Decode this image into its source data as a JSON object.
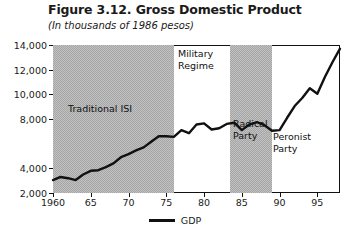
{
  "title": "Figure 3.12. Gross Domestic Product",
  "subtitle": "(In thousands of 1986 pesos)",
  "legend": {
    "label": "GDP"
  },
  "bands": [
    {
      "label": "Traditional ISI",
      "start": 1960,
      "end": 1976,
      "shaded": true
    },
    {
      "label": "Military\nRegime",
      "start": 1976,
      "end": 1983.5,
      "shaded": false
    },
    {
      "label": "Radical\nParty",
      "start": 1983.5,
      "end": 1989,
      "shaded": true
    },
    {
      "label": "Peronist\nParty",
      "start": 1989,
      "end": 1998,
      "shaded": false
    }
  ],
  "colors": {
    "line": "#111111",
    "band_shaded": "#a6a6a6",
    "band_plain": "#ffffff",
    "frame": "#111111"
  },
  "chart_data": {
    "type": "line",
    "title": "Figure 3.12. Gross Domestic Product",
    "subtitle": "(In thousands of 1986 pesos)",
    "xlabel": "",
    "ylabel": "",
    "xlim": [
      1960,
      1998
    ],
    "ylim": [
      2000,
      14000
    ],
    "grid": false,
    "legend_position": "bottom-center",
    "yticks": [
      2000,
      4000,
      8000,
      10000,
      12000,
      14000
    ],
    "ytick_labels": [
      "2,000",
      "4,000",
      "8,000",
      "10,000",
      "12,000",
      "14,000"
    ],
    "xticks": [
      1960,
      1965,
      1970,
      1975,
      1980,
      1985,
      1990,
      1995
    ],
    "xtick_labels": [
      "1960",
      "65",
      "70",
      "75",
      "80",
      "85",
      "90",
      "95"
    ],
    "series": [
      {
        "name": "GDP",
        "x": [
          1960,
          1961,
          1962,
          1963,
          1964,
          1965,
          1966,
          1967,
          1968,
          1969,
          1970,
          1971,
          1972,
          1973,
          1974,
          1975,
          1976,
          1977,
          1978,
          1979,
          1980,
          1981,
          1982,
          1983,
          1984,
          1985,
          1986,
          1987,
          1988,
          1989,
          1990,
          1991,
          1992,
          1993,
          1994,
          1995,
          1996,
          1997,
          1998
        ],
        "values": [
          3050,
          3300,
          3200,
          3050,
          3500,
          3800,
          3850,
          4100,
          4400,
          4900,
          5150,
          5450,
          5700,
          6150,
          6600,
          6600,
          6550,
          7100,
          6850,
          7550,
          7650,
          7150,
          7250,
          7600,
          7700,
          7100,
          7550,
          7750,
          7500,
          7050,
          7100,
          8100,
          9050,
          9700,
          10500,
          10050,
          11400,
          12600,
          13700
        ]
      }
    ],
    "annotations": [
      {
        "text": "Traditional ISI",
        "x_range": [
          1960,
          1976
        ]
      },
      {
        "text": "Military Regime",
        "x_range": [
          1976,
          1983.5
        ]
      },
      {
        "text": "Radical Party",
        "x_range": [
          1983.5,
          1989
        ]
      },
      {
        "text": "Peronist Party",
        "x_range": [
          1989,
          1998
        ]
      }
    ]
  }
}
